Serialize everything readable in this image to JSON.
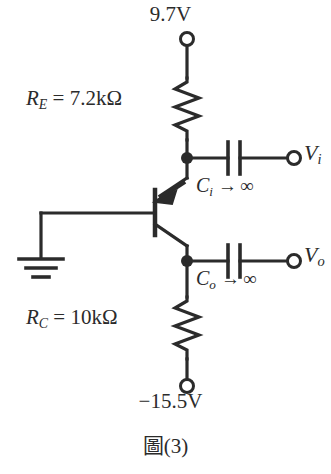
{
  "figure": {
    "caption_cjk": "圖",
    "caption_number": "(3)",
    "type": "transistor-amplifier-schematic"
  },
  "supplies": {
    "top_label": "9.7V",
    "bottom_label": "−15.5V"
  },
  "components": {
    "re": {
      "symbol": "R",
      "subscript": "E",
      "equals": "=",
      "value": "7.2kΩ",
      "full": "R_E = 7.2kΩ"
    },
    "rc": {
      "symbol": "R",
      "subscript": "C",
      "equals": "=",
      "value": "10kΩ",
      "full": "R_C = 10kΩ"
    },
    "ci": {
      "symbol": "C",
      "subscript": "i",
      "arrow": "→",
      "value": "∞",
      "full": "C_i → ∞"
    },
    "co": {
      "symbol": "C",
      "subscript": "o",
      "arrow": "→",
      "value": "∞",
      "full": "C_o → ∞"
    },
    "transistor": {
      "type": "PNP",
      "base_connection": "ground"
    }
  },
  "ports": {
    "input": {
      "symbol": "V",
      "subscript": "i",
      "full": "V_i"
    },
    "output": {
      "symbol": "V",
      "subscript": "o",
      "full": "V_o"
    }
  },
  "colors": {
    "ink": "#2b2b2b",
    "background": "#ffffff"
  }
}
